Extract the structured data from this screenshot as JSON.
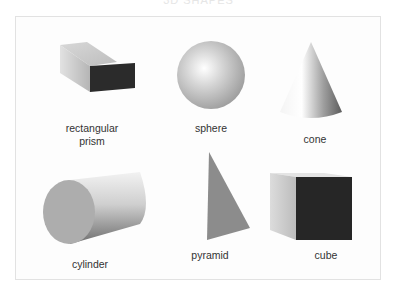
{
  "title": "3D SHAPES",
  "shapes": [
    {
      "name": "rectangular prism",
      "label_line1": "rectangular",
      "label_line2": "prism"
    },
    {
      "name": "sphere",
      "label": "sphere"
    },
    {
      "name": "cone",
      "label": "cone"
    },
    {
      "name": "cylinder",
      "label": "cylinder"
    },
    {
      "name": "pyramid",
      "label": "pyramid"
    },
    {
      "name": "cube",
      "label": "cube"
    }
  ],
  "colors": {
    "dark_face": "#2a2a2a",
    "light_face": "#cfcfcf",
    "mid_face": "#9a9a9a",
    "frame_border": "#e2e2e2"
  }
}
